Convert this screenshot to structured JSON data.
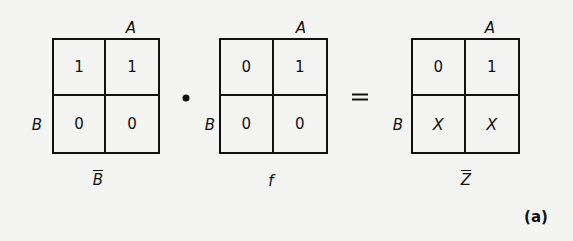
{
  "figure": {
    "tag": "(a)",
    "operator_and": "•",
    "operator_equals": "="
  },
  "maps": [
    {
      "name": "B-bar",
      "col_label": "A",
      "row_label": "B",
      "caption": "B",
      "caption_overline": true,
      "cells": [
        [
          "1",
          "1"
        ],
        [
          "0",
          "0"
        ]
      ]
    },
    {
      "name": "f",
      "col_label": "A",
      "row_label": "B",
      "caption": "f",
      "caption_overline": false,
      "cells": [
        [
          "0",
          "1"
        ],
        [
          "0",
          "0"
        ]
      ]
    },
    {
      "name": "Z-bar",
      "col_label": "A",
      "row_label": "B",
      "caption": "Z",
      "caption_overline": true,
      "cells": [
        [
          "0",
          "1"
        ],
        [
          "X",
          "X"
        ]
      ]
    }
  ]
}
